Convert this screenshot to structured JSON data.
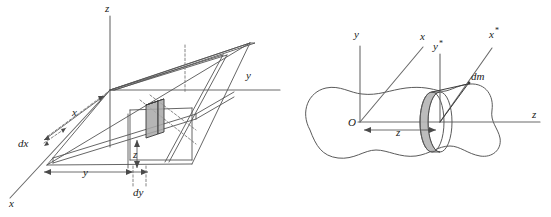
{
  "figure": {
    "background_color": "#ffffff",
    "line_color": "#555555",
    "shade_color": "#a8a8a8",
    "width": 551,
    "height": 217
  },
  "left_diagram": {
    "name": "cartesian-slab-element",
    "description": "Oblique 3D slab with a shaded differential volume element dx dy",
    "axes": [
      {
        "id": "z",
        "label": "z",
        "position": "top"
      },
      {
        "id": "y",
        "label": "y",
        "position": "right"
      },
      {
        "id": "x",
        "label": "x",
        "position": "bottom-left"
      }
    ],
    "dimension_labels": [
      {
        "id": "x-dim",
        "label": "x"
      },
      {
        "id": "dx-dim",
        "label": "dx"
      },
      {
        "id": "y-dim",
        "label": "y"
      },
      {
        "id": "dy-dim",
        "label": "dy"
      },
      {
        "id": "z-dim",
        "label": "z"
      }
    ]
  },
  "right_diagram": {
    "name": "rigid-body-disc-element",
    "description": "Arbitrary rigid body of revolution with a shaded differential disc element dm at distance z",
    "axes": [
      {
        "id": "y",
        "label": "y",
        "position": "vertical-origin"
      },
      {
        "id": "x",
        "label": "x",
        "position": "oblique-origin"
      },
      {
        "id": "y-star",
        "label": "y",
        "superscript": "*",
        "position": "vertical-disc"
      },
      {
        "id": "x-star",
        "label": "x",
        "superscript": "*",
        "position": "oblique-disc"
      },
      {
        "id": "z",
        "label": "z",
        "position": "right"
      }
    ],
    "origin_label": "O",
    "element_label": "dm",
    "dimension_labels": [
      {
        "id": "z-dim",
        "label": "z"
      }
    ]
  }
}
